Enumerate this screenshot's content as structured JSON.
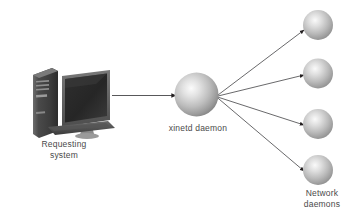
{
  "diagram": {
    "background_color": "#ffffff",
    "nodes": {
      "requesting_system": {
        "icon": "desktop-computer-icon",
        "label_line1": "Requesting",
        "label_line2": "system"
      },
      "xinetd_daemon": {
        "icon": "sphere-icon",
        "label": "xinetd daemon"
      },
      "network_daemons": {
        "icon": "sphere-icon",
        "label_line1": "Network",
        "label_line2": "daemons",
        "count": 4
      }
    },
    "colors": {
      "line": "#58585a",
      "arrowhead": "#231f20",
      "text": "#4a4a4a",
      "sphere_light": "#f2f2f2",
      "sphere_mid": "#b4b4b4",
      "sphere_dark": "#7d7d7d",
      "computer_dark": "#3a3a3a",
      "computer_mid": "#6e6e6e"
    }
  }
}
